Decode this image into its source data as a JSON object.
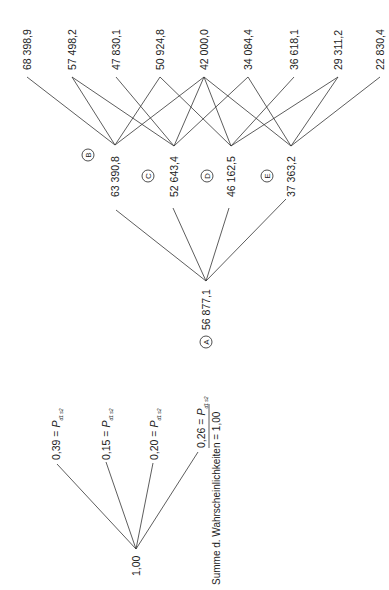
{
  "diagram": {
    "type": "decision-tree",
    "orientation": "rotated-90-ccw",
    "root": {
      "label": "1,00"
    },
    "probabilities": [
      {
        "value": "0,39",
        "eq": " = ",
        "symbol": "P",
        "subscript": "d1 s2"
      },
      {
        "value": "0,15",
        "eq": " = ",
        "symbol": "P",
        "subscript": "d1 s2"
      },
      {
        "value": "0,20",
        "eq": " = ",
        "symbol": "P",
        "subscript": "d1 s2"
      },
      {
        "value": "0,26",
        "eq": " = ",
        "symbol": "P",
        "subscript": "d1 s2"
      }
    ],
    "sum_note": "Summe d. Wahrscheinlichkeiten = 1,00",
    "node_a": {
      "letter": "A",
      "value": "56 877,1"
    },
    "mid_nodes": [
      {
        "letter": "B",
        "value": "63 390,8"
      },
      {
        "letter": "C",
        "value": "52 643,4"
      },
      {
        "letter": "D",
        "value": "46 162,5"
      },
      {
        "letter": "E",
        "value": "37 363,2"
      }
    ],
    "leaves": [
      "68 398,9",
      "57 498,2",
      "47 830,1",
      "50 924,8",
      "42 000,0",
      "34 084,4",
      "36 618,1",
      "29 311,2",
      "22 830,4"
    ],
    "edges": {
      "B": [
        "68 398,9",
        "57 498,2",
        "50 924,8",
        "42 000,0"
      ],
      "C": [
        "57 498,2",
        "47 830,1",
        "42 000,0",
        "34 084,4"
      ],
      "D": [
        "50 924,8",
        "42 000,0",
        "36 618,1",
        "29 311,2"
      ],
      "E": [
        "42 000,0",
        "34 084,4",
        "29 311,2",
        "22 830,4"
      ]
    }
  }
}
